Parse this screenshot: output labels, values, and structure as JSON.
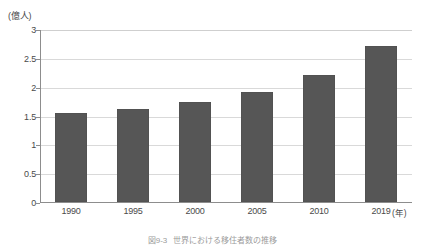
{
  "chart_data": {
    "type": "bar",
    "title": "",
    "categories": [
      "1990",
      "1995",
      "2000",
      "2005",
      "2010",
      "2019"
    ],
    "values": [
      1.55,
      1.62,
      1.73,
      1.9,
      2.2,
      2.7
    ],
    "series": [
      {
        "name": "世界人口",
        "values": [
          1.55,
          1.62,
          1.73,
          1.9,
          2.2,
          2.7
        ]
      }
    ],
    "xlabel": "(年)",
    "ylabel": "(億人)",
    "ylim": [
      0,
      3
    ],
    "ytick_labels": [
      "0",
      "0.5",
      "1",
      "1.5",
      "2",
      "2.5",
      "3"
    ],
    "ytick_values": [
      0,
      0.5,
      1,
      1.5,
      2,
      2.5,
      3
    ],
    "grid": true,
    "legend": "none",
    "bar_color": "#565656",
    "grid_color": "#d9d9d9",
    "axis_color": "#8d8d8d",
    "background_color": "#ffffff"
  },
  "axes": {
    "y_unit_label": "(億人)",
    "x_unit_label": "(年)"
  },
  "caption": {
    "number": "図9-3",
    "text": "世界における移住者数の推移"
  }
}
